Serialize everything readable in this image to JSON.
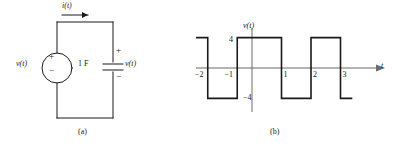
{
  "figure": {
    "panel_a": {
      "caption": "(a)",
      "current_label": "i(t)",
      "source_label": "v(t)",
      "source_plus": "+",
      "source_minus": "−",
      "capacitor_value": "1 F",
      "capacitor_plus": "+",
      "capacitor_minus": "−",
      "capacitor_voltage_label": "v(t)",
      "line_color": "#1a1a1a"
    },
    "panel_b": {
      "caption": "(b)",
      "y_axis_label": "v(t)",
      "x_axis_label": "t",
      "amplitude_pos_label": "4",
      "amplitude_neg_label": "−4",
      "tick_labels": [
        "−2",
        "−1",
        "1",
        "2",
        "3"
      ],
      "axis_color": "#6b6b6b",
      "wave_color": "#1a1a1a"
    }
  },
  "chart_data": {
    "type": "line",
    "title": "",
    "xlabel": "t",
    "ylabel": "v(t)",
    "xlim": [
      -3.0,
      3.6
    ],
    "ylim": [
      -6,
      6
    ],
    "grid": false,
    "legend": "none",
    "xticks": [
      -2,
      -1,
      1,
      2,
      3
    ],
    "xtick_labels": [
      "−2",
      "−1",
      "1",
      "2",
      "3"
    ],
    "yticks": [
      -4,
      4
    ],
    "ytick_labels": [
      "−4",
      "4"
    ],
    "annotations": [
      "4",
      "−4"
    ],
    "amplitude": 4,
    "period": 2,
    "series": [
      {
        "name": "v(t)",
        "x": [
          -3.0,
          -2.5,
          -2.5,
          -1.5,
          -1.5,
          -0.5,
          -0.5,
          1.0,
          1.0,
          2.0,
          2.0,
          3.0,
          3.0,
          3.4
        ],
        "values": [
          -4,
          -4,
          4,
          4,
          -4,
          -4,
          4,
          4,
          -4,
          -4,
          4,
          4,
          -4,
          -4
        ]
      }
    ]
  }
}
